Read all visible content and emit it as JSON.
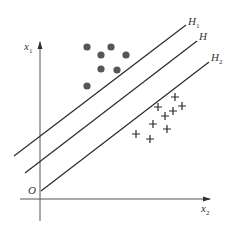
{
  "diagram": {
    "type": "svm-hyperplanes",
    "colors": {
      "line": "#2a2a2a",
      "axis": "#555555",
      "dot": "#555555",
      "plus": "#2a2a2a",
      "text": "#333333"
    },
    "axes": {
      "y_label": "x",
      "y_label_sub": "1",
      "x_label": "x",
      "x_label_sub": "2",
      "origin_label": "O"
    },
    "lines": [
      {
        "id": "H1",
        "label": "H",
        "sub": "1"
      },
      {
        "id": "H",
        "label": "H",
        "sub": ""
      },
      {
        "id": "H2",
        "label": "H",
        "sub": "2"
      }
    ],
    "class_dots": {
      "marker": "filled-circle",
      "count": 7,
      "points": [
        [
          87,
          47
        ],
        [
          111,
          47
        ],
        [
          101,
          55
        ],
        [
          126,
          55
        ],
        [
          101,
          69
        ],
        [
          117,
          70
        ],
        [
          87,
          86
        ]
      ]
    },
    "class_plus": {
      "marker": "plus",
      "count": 9,
      "points": [
        [
          175,
          97
        ],
        [
          158,
          107
        ],
        [
          182,
          106
        ],
        [
          173,
          111
        ],
        [
          165,
          116
        ],
        [
          153,
          124
        ],
        [
          167,
          129
        ],
        [
          136,
          134
        ],
        [
          150,
          139
        ]
      ]
    }
  }
}
